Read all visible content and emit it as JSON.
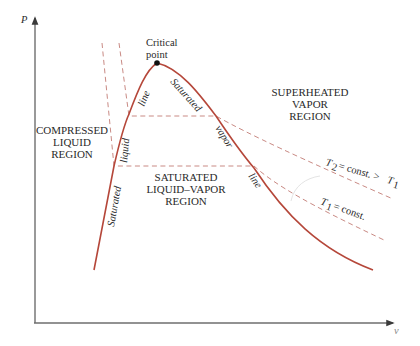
{
  "diagram": {
    "axes": {
      "y_label": "P",
      "x_label": "v"
    },
    "critical_point": {
      "label_line1": "Critical",
      "label_line2": "point"
    },
    "regions": {
      "compressed_liquid": [
        "COMPRESSED",
        "LIQUID",
        "REGION"
      ],
      "saturated_mixture": [
        "SATURATED",
        "LIQUID–VAPOR",
        "REGION"
      ],
      "superheated_vapor": [
        "SUPERHEATED",
        "VAPOR",
        "REGION"
      ]
    },
    "curve_labels": {
      "sat_liquid_lower": "Saturated",
      "sat_liquid_mid": "liquid",
      "sat_liquid_upper": "line",
      "sat_vapor_upper": "Saturated",
      "sat_vapor_mid": "vapor",
      "sat_vapor_lower": "line"
    },
    "isotherms": {
      "t2": {
        "symbol": "T",
        "sub": "2",
        "text": " = const. > ",
        "ref_symbol": "T",
        "ref_sub": "1"
      },
      "t1": {
        "symbol": "T",
        "sub": "1",
        "text": " = const."
      }
    },
    "colors": {
      "dome": "#b5473a",
      "isotherm": "#c98a84",
      "axis": "#6e6e6e",
      "text": "#2a2a2a"
    }
  }
}
